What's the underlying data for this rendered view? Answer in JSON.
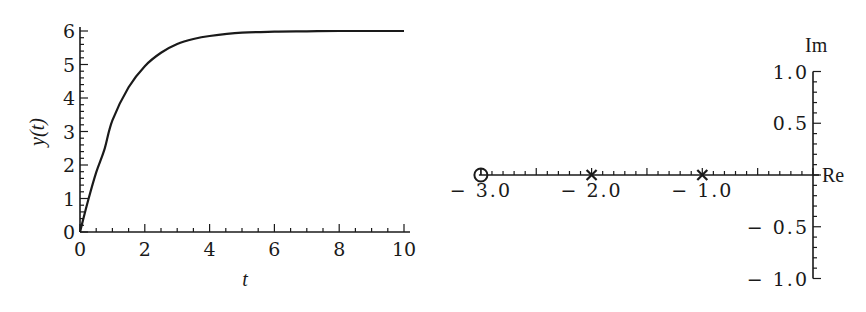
{
  "chart_data": [
    {
      "type": "line",
      "title": "",
      "xlabel": "t",
      "ylabel": "y(t)",
      "xlim": [
        0,
        10
      ],
      "ylim": [
        0,
        6
      ],
      "x_ticks": [
        "0",
        "2",
        "4",
        "6",
        "8",
        "10"
      ],
      "y_ticks": [
        "0",
        "1",
        "2",
        "3",
        "4",
        "5",
        "6"
      ],
      "grid": false,
      "legend": null,
      "series": [
        {
          "name": "y(t)",
          "x": [
            0,
            0.25,
            0.5,
            0.75,
            1,
            1.5,
            2,
            2.5,
            3,
            3.5,
            4,
            5,
            6,
            7,
            8,
            9,
            10
          ],
          "values": [
            0,
            0.94,
            1.78,
            2.45,
            3.33,
            4.32,
            4.95,
            5.35,
            5.61,
            5.76,
            5.85,
            5.95,
            5.98,
            5.99,
            6.0,
            6.0,
            6.0
          ]
        }
      ]
    },
    {
      "type": "scatter",
      "title": "",
      "xlabel": "Re",
      "ylabel": "Im",
      "xlim": [
        -3.0,
        0
      ],
      "ylim": [
        -1.0,
        1.0
      ],
      "x_ticks": [
        "−3.0",
        "−2.0",
        "−1.0"
      ],
      "y_ticks": [
        "1.0",
        "0.5",
        "−0.5",
        "−1.0"
      ],
      "grid": false,
      "series": [
        {
          "name": "zero",
          "marker": "circle",
          "points": [
            [
              -3.0,
              0
            ]
          ]
        },
        {
          "name": "poles",
          "marker": "x",
          "points": [
            [
              -2.0,
              0
            ],
            [
              -1.0,
              0
            ]
          ]
        }
      ]
    }
  ],
  "left_plot": {
    "xlabel": "t",
    "ylabel": "y(t)",
    "x_tick_labels": [
      "0",
      "2",
      "4",
      "6",
      "8",
      "10"
    ],
    "y_tick_labels": [
      "0",
      "1",
      "2",
      "3",
      "4",
      "5",
      "6"
    ]
  },
  "right_plot": {
    "re_label": "Re",
    "im_label": "Im",
    "re_tick_labels": [
      "−3.0",
      "−2.0",
      "−1.0"
    ],
    "im_tick_labels": [
      "1.0",
      "0.5",
      "−0.5",
      "−1.0"
    ]
  }
}
